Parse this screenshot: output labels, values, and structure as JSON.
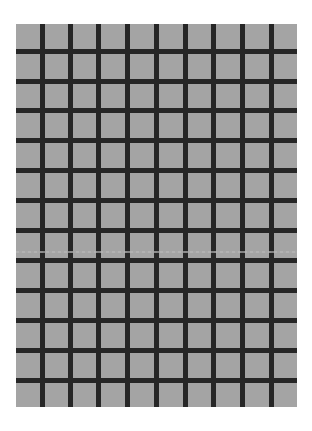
{
  "image": {
    "description": "Gray square grid with dark grid lines",
    "background_color": "#ffffff",
    "cell_color": "#a4a4a4",
    "line_color": "#262626"
  },
  "grid": {
    "columns": 10,
    "rows": 13,
    "left": 16,
    "top": 24,
    "width": 281,
    "height": 383,
    "line_thickness": 5,
    "vertical_lines_x": [
      42,
      70,
      98,
      127,
      156,
      185,
      213,
      242,
      271
    ],
    "horizontal_lines_y": [
      51,
      81,
      110,
      140,
      170,
      200,
      230,
      260,
      290,
      320,
      350,
      380
    ],
    "artifact_line_y": 251
  }
}
